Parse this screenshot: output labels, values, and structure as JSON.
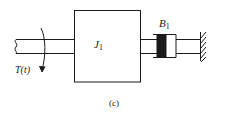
{
  "diagram": {
    "type": "mechanical-rotational-system",
    "caption": "(c)",
    "torque_label": "T(t)",
    "inertia": {
      "symbol": "J",
      "subscript": "1"
    },
    "damper": {
      "symbol": "B",
      "subscript": "1"
    },
    "components": [
      "input shaft",
      "applied torque T(t)",
      "inertia J1",
      "connecting shaft",
      "rotational damper B1",
      "fixed wall"
    ],
    "colors": {
      "line": "#1a1a1a",
      "damper_fill": "#1a1a1a",
      "background": "#ffffff"
    }
  }
}
